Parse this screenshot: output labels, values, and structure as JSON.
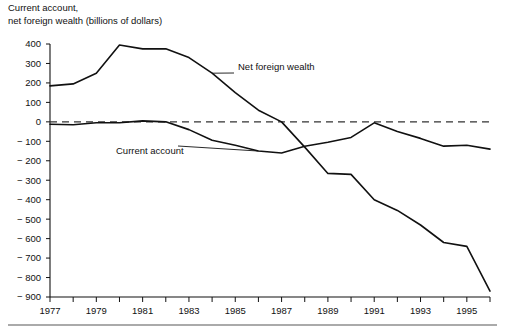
{
  "chart_data": {
    "type": "line",
    "title_line1": "Current account,",
    "title_line2": "net foreign wealth (billions of dollars)",
    "xlabel": "",
    "ylabel": "",
    "grid": false,
    "legend_position": "inline-annotations",
    "xlim": [
      1977,
      1996
    ],
    "ylim": [
      -900,
      400
    ],
    "x": [
      1977,
      1978,
      1979,
      1980,
      1981,
      1982,
      1983,
      1984,
      1985,
      1986,
      1987,
      1988,
      1989,
      1990,
      1991,
      1992,
      1993,
      1994,
      1995,
      1996
    ],
    "categories": [
      "1977",
      "1978",
      "1979",
      "1980",
      "1981",
      "1982",
      "1983",
      "1984",
      "1985",
      "1986",
      "1987",
      "1988",
      "1989",
      "1990",
      "1991",
      "1992",
      "1993",
      "1994",
      "1995",
      "1996"
    ],
    "xticks": [
      1977,
      1978,
      1979,
      1980,
      1981,
      1982,
      1983,
      1984,
      1985,
      1986,
      1987,
      1988,
      1989,
      1990,
      1991,
      1992,
      1993,
      1994,
      1995,
      1996
    ],
    "xtick_labels": [
      "1977",
      "",
      "1979",
      "",
      "1981",
      "",
      "1983",
      "",
      "1985",
      "",
      "1987",
      "",
      "1989",
      "",
      "1991",
      "",
      "1993",
      "",
      "1995",
      ""
    ],
    "yticks": [
      400,
      300,
      200,
      100,
      0,
      -100,
      -200,
      -300,
      -400,
      -500,
      -600,
      -700,
      -800,
      -900
    ],
    "ytick_labels": [
      "400",
      "300",
      "200",
      "100",
      "0",
      "− 100",
      "− 200",
      "− 300",
      "− 400",
      "− 500",
      "− 600",
      "− 700",
      "− 800",
      "− 900"
    ],
    "reference_line": {
      "value": 0,
      "style": "dashed"
    },
    "series": [
      {
        "name": "Net foreign wealth",
        "label": "Net foreign wealth",
        "color": "#111111",
        "values": [
          185,
          195,
          250,
          395,
          375,
          375,
          330,
          250,
          150,
          60,
          0,
          -130,
          -265,
          -270,
          -400,
          -455,
          -530,
          -620,
          -640,
          -870
        ]
      },
      {
        "name": "Current account",
        "label": "Current account",
        "color": "#111111",
        "values": [
          -12,
          -15,
          -5,
          -5,
          5,
          0,
          -40,
          -95,
          -120,
          -150,
          -160,
          -125,
          -105,
          -80,
          -5,
          -50,
          -85,
          -125,
          -120,
          -140
        ]
      }
    ],
    "annotations": [
      {
        "text": "Net foreign wealth",
        "target_year": 1984,
        "target_value": 250
      },
      {
        "text": "Current account",
        "target_year": 1986,
        "target_value": -150
      }
    ]
  }
}
